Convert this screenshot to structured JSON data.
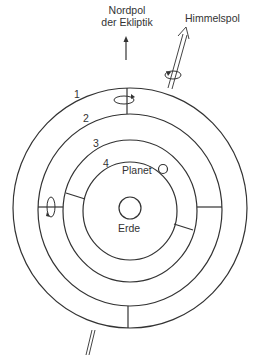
{
  "diagram": {
    "type": "celestial-spheres-model",
    "labels": {
      "ecliptic_pole_line1": "Nordpol",
      "ecliptic_pole_line2": "der Ekliptik",
      "celestial_pole": "Himmelspol",
      "sphere_1": "1",
      "sphere_2": "2",
      "sphere_3": "3",
      "sphere_4": "4",
      "planet": "Planet",
      "earth": "Erde"
    },
    "spheres": [
      {
        "id": 1,
        "cx": 130,
        "cy": 208,
        "rx": 117,
        "ry": 120
      },
      {
        "id": 2,
        "cx": 130,
        "cy": 210,
        "rx": 92,
        "ry": 96
      },
      {
        "id": 3,
        "cx": 130,
        "cy": 211,
        "rx": 67,
        "ry": 71
      },
      {
        "id": 4,
        "cx": 130,
        "cy": 211,
        "rx": 47,
        "ry": 49
      }
    ],
    "earth": {
      "cx": 130,
      "cy": 208,
      "r": 11
    },
    "planet": {
      "cx": 163,
      "cy": 169,
      "r": 4.5
    },
    "colors": {
      "line": "#333333",
      "background": "#ffffff"
    }
  }
}
